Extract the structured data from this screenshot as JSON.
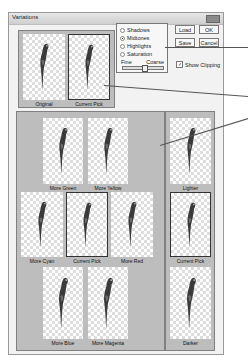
{
  "window": {
    "title": "Variations"
  },
  "top_panel": {
    "thumbs": [
      {
        "label": "Original",
        "selected": false
      },
      {
        "label": "Current Pick",
        "selected": true
      }
    ]
  },
  "options": {
    "radios": [
      {
        "label": "Shadows",
        "checked": false
      },
      {
        "label": "Midtones",
        "checked": true
      },
      {
        "label": "Highlights",
        "checked": false
      },
      {
        "label": "Saturation",
        "checked": false
      }
    ],
    "slider": {
      "min_label": "Fine",
      "max_label": "Coarse"
    },
    "show_clipping": {
      "label": "Show Clipping",
      "checked": true
    }
  },
  "buttons": {
    "load": "Load",
    "ok": "OK",
    "save": "Save",
    "cancel": "Cancel"
  },
  "color_panel": {
    "thumbs": [
      {
        "label": "More Green"
      },
      {
        "label": "More Yellow"
      },
      {
        "label": "More Cyan"
      },
      {
        "label": "Current Pick"
      },
      {
        "label": "More Red"
      },
      {
        "label": "More Blue"
      },
      {
        "label": "More Magenta"
      }
    ]
  },
  "brightness_panel": {
    "thumbs": [
      {
        "label": "Lighter"
      },
      {
        "label": "Current Pick"
      },
      {
        "label": "Darker"
      }
    ]
  }
}
